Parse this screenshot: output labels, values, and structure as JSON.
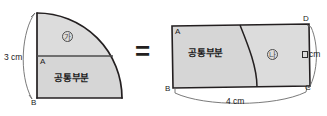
{
  "figure": {
    "kind": "geometry-diagram",
    "equals_sign": "=",
    "colors": {
      "fill": "#d6d6d6",
      "stroke_heavy": "#231f20",
      "stroke_light": "#6b6b6b",
      "text": "#1b1b1b",
      "background": "#ffffff"
    },
    "left_shape": {
      "name": "quarter-circle",
      "points": {
        "a": "A",
        "b": "B"
      },
      "dimensions": [
        {
          "id": "radius",
          "value": "3 cm"
        }
      ],
      "regions": [
        {
          "id": "ga",
          "symbol": "㉼",
          "letter": "가"
        },
        {
          "id": "shared",
          "label": "공통부분"
        }
      ]
    },
    "right_shape": {
      "name": "rectangle",
      "points": {
        "a": "A",
        "b": "B",
        "c": "C",
        "d": "D"
      },
      "dimensions": [
        {
          "id": "width",
          "value": "4 cm"
        },
        {
          "id": "height",
          "value": "cm",
          "prefix_blank": true
        }
      ],
      "regions": [
        {
          "id": "na",
          "symbol": "㉽",
          "letter": "나"
        },
        {
          "id": "shared",
          "label": "공통부분"
        }
      ]
    }
  }
}
